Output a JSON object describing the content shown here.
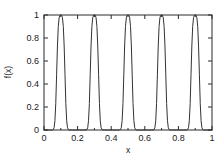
{
  "chart_data": {
    "type": "line",
    "title": "",
    "subtitle": "",
    "xlabel": "x",
    "ylabel": "f(x)",
    "xlim": [
      0,
      1
    ],
    "ylim": [
      0,
      1
    ],
    "grid": false,
    "legend": null,
    "legend_position": "none",
    "frame": "box",
    "tick_direction": "in",
    "line_color": "#333333",
    "background_color": "#ffffff",
    "xticks": [
      0,
      0.2,
      0.4,
      0.6,
      0.8,
      1
    ],
    "xtick_labels": [
      "0",
      "0.2",
      "0.4",
      "0.6",
      "0.8",
      "1"
    ],
    "yticks": [
      0,
      0.2,
      0.4,
      0.6,
      0.8,
      1
    ],
    "ytick_labels": [
      "0",
      "0.2",
      "0.4",
      "0.6",
      "0.8",
      "1"
    ],
    "peaks_x": [
      0.1,
      0.3,
      0.5,
      0.7,
      0.9
    ],
    "peak_value": 1,
    "peak_half_width": 0.035,
    "period": 0.2,
    "series": [
      {
        "name": "f(x)",
        "color": "#333333",
        "x": [
          0.0,
          0.01,
          0.02,
          0.03,
          0.04,
          0.05,
          0.055,
          0.06,
          0.065,
          0.07,
          0.075,
          0.08,
          0.085,
          0.09,
          0.095,
          0.1,
          0.105,
          0.11,
          0.115,
          0.12,
          0.125,
          0.13,
          0.135,
          0.14,
          0.145,
          0.15,
          0.16,
          0.17,
          0.18,
          0.19,
          0.2,
          0.21,
          0.22,
          0.23,
          0.24,
          0.25,
          0.255,
          0.26,
          0.265,
          0.27,
          0.275,
          0.28,
          0.285,
          0.29,
          0.295,
          0.3,
          0.305,
          0.31,
          0.315,
          0.32,
          0.325,
          0.33,
          0.335,
          0.34,
          0.345,
          0.35,
          0.36,
          0.37,
          0.38,
          0.39,
          0.4,
          0.41,
          0.42,
          0.43,
          0.44,
          0.45,
          0.455,
          0.46,
          0.465,
          0.47,
          0.475,
          0.48,
          0.485,
          0.49,
          0.495,
          0.5,
          0.505,
          0.51,
          0.515,
          0.52,
          0.525,
          0.53,
          0.535,
          0.54,
          0.545,
          0.55,
          0.56,
          0.57,
          0.58,
          0.59,
          0.6,
          0.61,
          0.62,
          0.63,
          0.64,
          0.65,
          0.655,
          0.66,
          0.665,
          0.67,
          0.675,
          0.68,
          0.685,
          0.69,
          0.695,
          0.7,
          0.705,
          0.71,
          0.715,
          0.72,
          0.725,
          0.73,
          0.735,
          0.74,
          0.745,
          0.75,
          0.76,
          0.77,
          0.78,
          0.79,
          0.8,
          0.81,
          0.82,
          0.83,
          0.84,
          0.85,
          0.855,
          0.86,
          0.865,
          0.87,
          0.875,
          0.88,
          0.885,
          0.89,
          0.895,
          0.9,
          0.905,
          0.91,
          0.915,
          0.92,
          0.925,
          0.93,
          0.935,
          0.94,
          0.945,
          0.95,
          0.96,
          0.97,
          0.98,
          0.99,
          1.0
        ],
        "y": [
          0.0,
          0.0,
          0.0,
          0.0,
          0.0,
          0.0,
          0.003,
          0.02,
          0.08,
          0.23,
          0.48,
          0.73,
          0.9,
          0.975,
          0.998,
          1.0,
          0.998,
          0.975,
          0.9,
          0.73,
          0.48,
          0.23,
          0.08,
          0.02,
          0.003,
          0.0,
          0.0,
          0.0,
          0.0,
          0.0,
          0.0,
          0.0,
          0.0,
          0.0,
          0.0,
          0.0,
          0.003,
          0.02,
          0.08,
          0.23,
          0.48,
          0.73,
          0.9,
          0.975,
          0.998,
          1.0,
          0.998,
          0.975,
          0.9,
          0.73,
          0.48,
          0.23,
          0.08,
          0.02,
          0.003,
          0.0,
          0.0,
          0.0,
          0.0,
          0.0,
          0.0,
          0.0,
          0.0,
          0.0,
          0.0,
          0.0,
          0.003,
          0.02,
          0.08,
          0.23,
          0.48,
          0.73,
          0.9,
          0.975,
          0.998,
          1.0,
          0.998,
          0.975,
          0.9,
          0.73,
          0.48,
          0.23,
          0.08,
          0.02,
          0.003,
          0.0,
          0.0,
          0.0,
          0.0,
          0.0,
          0.0,
          0.0,
          0.0,
          0.0,
          0.0,
          0.0,
          0.003,
          0.02,
          0.08,
          0.23,
          0.48,
          0.73,
          0.9,
          0.975,
          0.998,
          1.0,
          0.998,
          0.975,
          0.9,
          0.73,
          0.48,
          0.23,
          0.08,
          0.02,
          0.003,
          0.0,
          0.0,
          0.0,
          0.0,
          0.0,
          0.0,
          0.0,
          0.0,
          0.0,
          0.0,
          0.0,
          0.003,
          0.02,
          0.08,
          0.23,
          0.48,
          0.73,
          0.9,
          0.975,
          0.998,
          1.0,
          0.998,
          0.975,
          0.9,
          0.73,
          0.48,
          0.23,
          0.08,
          0.02,
          0.003,
          0.0,
          0.0,
          0.0,
          0.0,
          0.0,
          0.0
        ]
      }
    ]
  }
}
